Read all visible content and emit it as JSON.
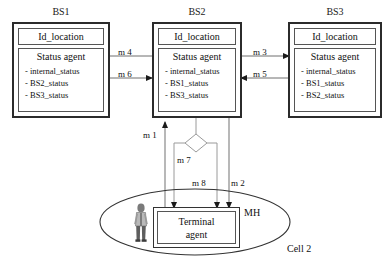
{
  "diagram": {
    "title_bs1": "BS1",
    "title_bs2": "BS2",
    "title_bs3": "BS3",
    "id_location_label": "Id_location",
    "status_agent_label": "Status agent",
    "bs1_attrs": [
      "- internal_status",
      "- BS2_status",
      "- BS3_status"
    ],
    "bs2_attrs": [
      "- internal_status",
      "- BS1_status",
      "- BS3_status"
    ],
    "bs3_attrs": [
      "- internal_status",
      "- BS1_status",
      "- BS2_status"
    ],
    "messages": {
      "m1": "m 1",
      "m2": "m 2",
      "m3": "m 3",
      "m4": "m 4",
      "m5": "m 5",
      "m6": "m 6",
      "m7": "m 7",
      "m8": "m 8"
    },
    "terminal_agent_line1": "Terminal",
    "terminal_agent_line2": "agent",
    "mh_label": "MH",
    "cell_label": "Cell 2",
    "colors": {
      "box_border": "#2b2b2b",
      "inner_border": "#555555",
      "connector": "#8a8a8a",
      "arrow": "#1a1a1a",
      "text": "#111111",
      "background": "#ffffff"
    }
  }
}
